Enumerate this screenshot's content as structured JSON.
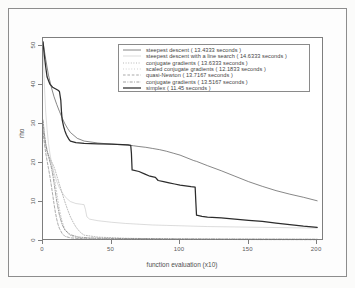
{
  "chart_data": {
    "type": "line",
    "title": "",
    "xlabel": "function evaluation (x10)",
    "ylabel": "rho",
    "xlim": [
      0,
      205
    ],
    "ylim": [
      0,
      52
    ],
    "xticks": [
      0,
      50,
      100,
      150,
      200
    ],
    "yticks": [
      0,
      10,
      20,
      30,
      40,
      50
    ],
    "grid": false,
    "legend_position": "top-center",
    "series": [
      {
        "name": "steepest descent ( 13.4333 seconds )",
        "label": "steepest descent",
        "seconds": 13.4333,
        "style": "solid",
        "color": "#4a4a4a",
        "x": [
          0,
          2,
          4,
          6,
          8,
          10,
          12,
          14,
          16,
          18,
          20,
          25,
          30,
          40,
          50,
          60,
          64,
          66,
          70,
          75,
          80,
          85,
          90,
          95,
          100,
          105,
          110,
          112,
          120,
          130,
          140,
          150,
          160,
          170,
          180,
          190,
          200
        ],
        "y": [
          51,
          46.5,
          42.5,
          39.5,
          37,
          35,
          33.2,
          31.5,
          30,
          28.8,
          27.8,
          26.3,
          25.6,
          25.1,
          24.8,
          24.6,
          24.5,
          24.4,
          24.2,
          24.0,
          23.7,
          23.4,
          23.0,
          22.5,
          22.0,
          21.3,
          20.6,
          20.4,
          19.3,
          18.0,
          16.6,
          15.2,
          14.0,
          12.9,
          12.0,
          11.2,
          10.3
        ]
      },
      {
        "name": "steepest descent with a line search ( 14.6333 seconds )",
        "label": "steepest descent with a line search",
        "seconds": 14.6333,
        "style": "solid-light",
        "color": "#b2b2b2",
        "x": [
          0,
          1,
          2,
          3,
          4,
          5,
          6,
          7,
          8,
          10,
          12,
          14,
          16,
          18,
          20,
          24,
          28,
          30,
          31,
          32,
          34,
          40,
          50,
          60,
          70,
          80,
          90,
          100,
          110,
          120,
          140,
          160,
          180,
          200
        ],
        "y": [
          51,
          40.0,
          33.0,
          28.5,
          25.0,
          22.5,
          20.5,
          19.0,
          17.5,
          15.3,
          13.6,
          12.4,
          11.4,
          10.7,
          10.1,
          9.6,
          9.4,
          9.3,
          8.0,
          6.2,
          5.6,
          5.2,
          4.8,
          4.5,
          4.3,
          4.1,
          4.0,
          3.9,
          3.8,
          3.7,
          3.6,
          3.5,
          3.4,
          3.3
        ]
      },
      {
        "name": "conjugate gradients ( 13.6333 seconds )",
        "label": "conjugate gradients",
        "seconds": 13.6333,
        "style": "dotted",
        "color": "#8f8f8f",
        "x": [
          0,
          1,
          2,
          3,
          4,
          5,
          6,
          7,
          8,
          9,
          10,
          12,
          14,
          16,
          18,
          20,
          22,
          24,
          26,
          28,
          30,
          40,
          60,
          80,
          100,
          140,
          200
        ],
        "y": [
          30.5,
          27.0,
          24.5,
          23.0,
          22.0,
          21.2,
          20.5,
          19.8,
          19.0,
          18.0,
          16.8,
          14.5,
          12.2,
          10.0,
          8.0,
          6.2,
          4.8,
          3.6,
          2.7,
          2.0,
          1.5,
          1.0,
          0.7,
          0.6,
          0.5,
          0.45,
          0.4
        ]
      },
      {
        "name": "scaled conjugate gradients ( 12.1833 seconds )",
        "label": "scaled conjugate gradients",
        "seconds": 12.1833,
        "style": "dotted-fine",
        "color": "#a0a0a0",
        "x": [
          0,
          1,
          2,
          3,
          4,
          5,
          6,
          7,
          8,
          9,
          10,
          11,
          12,
          13,
          14,
          15,
          16,
          18,
          20,
          24,
          30,
          40,
          60,
          100,
          200
        ],
        "y": [
          29.0,
          26.0,
          24.0,
          22.6,
          21.5,
          20.6,
          19.6,
          18.3,
          16.6,
          14.6,
          12.4,
          10.2,
          8.2,
          6.4,
          5.0,
          3.9,
          3.0,
          2.0,
          1.4,
          0.9,
          0.6,
          0.5,
          0.45,
          0.4,
          0.35
        ]
      },
      {
        "name": "quasi-Newton ( 13.7167 seconds )",
        "label": "quasi-Newton",
        "seconds": 13.7167,
        "style": "dashed",
        "color": "#777777",
        "x": [
          0,
          1,
          2,
          3,
          4,
          5,
          6,
          7,
          8,
          9,
          10,
          11,
          12,
          14,
          16,
          20,
          30,
          50,
          100,
          200
        ],
        "y": [
          28.0,
          25.0,
          22.5,
          20.5,
          18.6,
          16.6,
          14.4,
          12.0,
          9.6,
          7.4,
          5.6,
          4.2,
          3.2,
          1.9,
          1.2,
          0.8,
          0.55,
          0.45,
          0.4,
          0.35
        ]
      },
      {
        "name": "conjugate gradients ( 13.5167 seconds )",
        "label": "conjugate gradients",
        "seconds": 13.5167,
        "style": "dash-dot",
        "color": "#6b6b6b",
        "x": [
          0,
          1,
          2,
          3,
          4,
          5,
          6,
          7,
          8,
          9,
          10,
          12,
          14,
          16,
          20,
          26,
          34,
          44,
          60,
          90,
          140,
          200
        ],
        "y": [
          31.0,
          27.5,
          25.0,
          23.2,
          21.8,
          20.4,
          19.0,
          17.2,
          15.0,
          12.6,
          10.2,
          6.6,
          4.2,
          2.8,
          1.6,
          1.0,
          0.8,
          0.7,
          0.62,
          0.55,
          0.5,
          0.45
        ]
      },
      {
        "name": "simplex ( 11.45 seconds )",
        "label": "simplex",
        "seconds": 11.45,
        "style": "thick-solid",
        "color": "#2c2c2c",
        "x": [
          0,
          1,
          2,
          3,
          5,
          7,
          9,
          10,
          11,
          12,
          13,
          13.5,
          14,
          15,
          16,
          17,
          18,
          19,
          20,
          24,
          30,
          40,
          50,
          58,
          62,
          64,
          64.5,
          65,
          70,
          74,
          78,
          82,
          84,
          88,
          92,
          96,
          100,
          104,
          108,
          111,
          111.5,
          112,
          116,
          120,
          130,
          140,
          150,
          160,
          170,
          180,
          190,
          200
        ],
        "y": [
          51,
          47.5,
          44.5,
          42.0,
          40.2,
          39.4,
          39.0,
          38.8,
          38.6,
          38.3,
          36.0,
          33.0,
          31.0,
          29.4,
          28.2,
          27.3,
          26.6,
          26.0,
          25.6,
          25.2,
          25.0,
          24.9,
          24.8,
          24.7,
          24.6,
          24.5,
          22.5,
          18.2,
          17.8,
          17.2,
          16.6,
          16.3,
          15.5,
          15.2,
          14.9,
          14.6,
          14.3,
          14.1,
          13.9,
          13.8,
          10.0,
          6.6,
          6.3,
          6.1,
          5.9,
          5.6,
          5.3,
          5.0,
          4.6,
          4.2,
          3.8,
          3.5
        ]
      }
    ]
  },
  "axes": {
    "y_title": "rho",
    "x_title": "function evaluation (x10)",
    "x_tick_labels": [
      "0",
      "50",
      "100",
      "150",
      "200"
    ],
    "y_tick_labels": [
      "0",
      "10",
      "20",
      "30",
      "40",
      "50"
    ]
  },
  "legend": {
    "entries": [
      "steepest descent ( 13.4333 seconds )",
      "steepest descent with a line search ( 14.6333 seconds )",
      "conjugate gradients ( 13.6333 seconds )",
      "scaled conjugate gradients ( 12.1833 seconds )",
      "quasi-Newton ( 13.7167 seconds )",
      "conjugate gradients ( 13.5167 seconds )",
      "simplex ( 11.45 seconds )"
    ]
  },
  "colors": {
    "frame": "#7e7e7e",
    "outer_border": "#8d8d8d",
    "background": "#fdfdfd",
    "text": "#4f4f4f"
  }
}
